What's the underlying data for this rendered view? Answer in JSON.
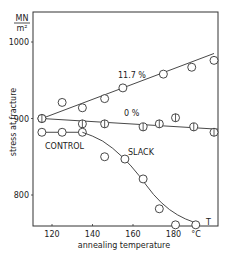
{
  "chart_data": {
    "type": "line",
    "title": "",
    "xlabel": "annealing temperature",
    "ylabel": "stress at fracture",
    "y_unit_top": "MN",
    "y_unit_bottom": "m²",
    "x_unit": "°C",
    "xlim": [
      110,
      202
    ],
    "ylim": [
      760,
      1040
    ],
    "x_ticks": [
      120,
      140,
      160,
      180
    ],
    "y_ticks": [
      800,
      900,
      1000
    ],
    "grid": false,
    "annotations": [
      "11.7 %",
      "0 %",
      "CONTROL",
      "SLACK",
      "T"
    ],
    "series": [
      {
        "name": "11.7 %",
        "marker": "open-circle",
        "points": [
          [
            115,
            900
          ],
          [
            125,
            921
          ],
          [
            135,
            914
          ],
          [
            146,
            926
          ],
          [
            155,
            940
          ],
          [
            175,
            958
          ],
          [
            189,
            967
          ],
          [
            200,
            976
          ]
        ],
        "fit_line": [
          [
            115,
            900
          ],
          [
            200,
            985
          ]
        ]
      },
      {
        "name": "0 %",
        "marker": "barred-circle",
        "points": [
          [
            115,
            900
          ],
          [
            135,
            893
          ],
          [
            146,
            893
          ],
          [
            165,
            889
          ],
          [
            173,
            893
          ],
          [
            181,
            901
          ],
          [
            190,
            889
          ],
          [
            200,
            882
          ]
        ],
        "fit_line": [
          [
            115,
            900
          ],
          [
            202,
            886
          ]
        ]
      },
      {
        "name": "CONTROL",
        "marker": "open-circle",
        "points": [
          [
            115,
            882
          ],
          [
            125,
            882
          ],
          [
            135,
            882
          ]
        ],
        "fit_line": [
          [
            115,
            882
          ],
          [
            135,
            882
          ]
        ]
      },
      {
        "name": "SLACK",
        "marker": "open-circle",
        "points": [
          [
            146,
            850
          ],
          [
            156,
            847
          ],
          [
            165,
            821
          ],
          [
            173,
            782
          ],
          [
            181,
            761
          ],
          [
            191,
            761
          ]
        ],
        "curve": [
          [
            135,
            882
          ],
          [
            145,
            872
          ],
          [
            155,
            850
          ],
          [
            163,
            826
          ],
          [
            170,
            800
          ],
          [
            178,
            780
          ],
          [
            186,
            768
          ],
          [
            193,
            762
          ]
        ]
      }
    ]
  }
}
